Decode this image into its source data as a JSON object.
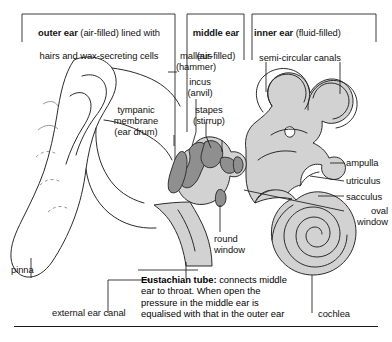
{
  "diagram": {
    "type": "anatomical-cross-section",
    "colors": {
      "background": "#ffffff",
      "tissue_fill": "#d2d2d2",
      "ossicle_fill": "#8f8f8f",
      "outline": "#2b2b2b",
      "text": "#111111",
      "leader_line": "#1a1a1a"
    }
  },
  "brackets": [
    {
      "id": "outer",
      "bold": "outer ear",
      "rest": " (air-filled) lined with",
      "line2": "hairs and wax-secreting cells"
    },
    {
      "id": "middle",
      "bold": "middle ear",
      "rest": "",
      "line2": "(air-filled)"
    },
    {
      "id": "inner",
      "bold": "inner ear",
      "rest": " (fluid-filled)",
      "line2": ""
    }
  ],
  "labels": {
    "malleus": "malleus\n(hammer)",
    "incus": "incus\n(anvil)",
    "stapes": "stapes\n(stirrup)",
    "tympanic_membrane": "tympanic\nmembrane\n(ear drum)",
    "semi_circular_canals": "semi-circular canals",
    "ampulla": "ampulla",
    "utriculus": "utriculus",
    "sacculus": "sacculus",
    "oval_window": "oval\nwindow",
    "round_window": "round\nwindow",
    "cochlea": "cochlea",
    "pinna": "pinna",
    "external_ear_canal": "external ear canal"
  },
  "caption": {
    "bold": "Eustachian tube:",
    "line1_rest": " connects middle",
    "line2": "ear to throat. When open the",
    "line3": "pressure in the middle ear is",
    "line4": "equalised with that in the outer ear"
  }
}
